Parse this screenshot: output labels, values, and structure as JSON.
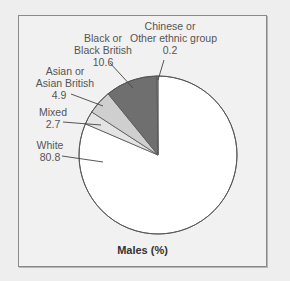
{
  "chart_data": {
    "type": "pie",
    "title": "Males (%)",
    "start_angle_deg": 0,
    "direction": "counterclockwise-labels-from-top",
    "slices": [
      {
        "label": "White",
        "value": 80.8,
        "color": "#ffffff"
      },
      {
        "label": "Mixed",
        "value": 2.7,
        "color": "#e4e4e4"
      },
      {
        "label": "Asian or Asian British",
        "value": 4.9,
        "color": "#cfcfcf"
      },
      {
        "label": "Black or Black British",
        "value": 10.6,
        "color": "#6f6f6f"
      },
      {
        "label": "Chinese or Other ethnic group",
        "value": 0.2,
        "color": "#9a9a9a"
      }
    ],
    "legend": "none (callout labels)"
  },
  "labels": {
    "chinese": {
      "line1": "Chinese or",
      "line2": "Other ethnic group",
      "value": "0.2"
    },
    "black": {
      "line1": "Black or",
      "line2": "Black British",
      "value": "10.6"
    },
    "asian": {
      "line1": "Asian or",
      "line2": "Asian British",
      "value": "4.9"
    },
    "mixed": {
      "line1": "Mixed",
      "value": "2.7"
    },
    "white": {
      "line1": "White",
      "value": "80.8"
    }
  },
  "title": "Males (%)"
}
